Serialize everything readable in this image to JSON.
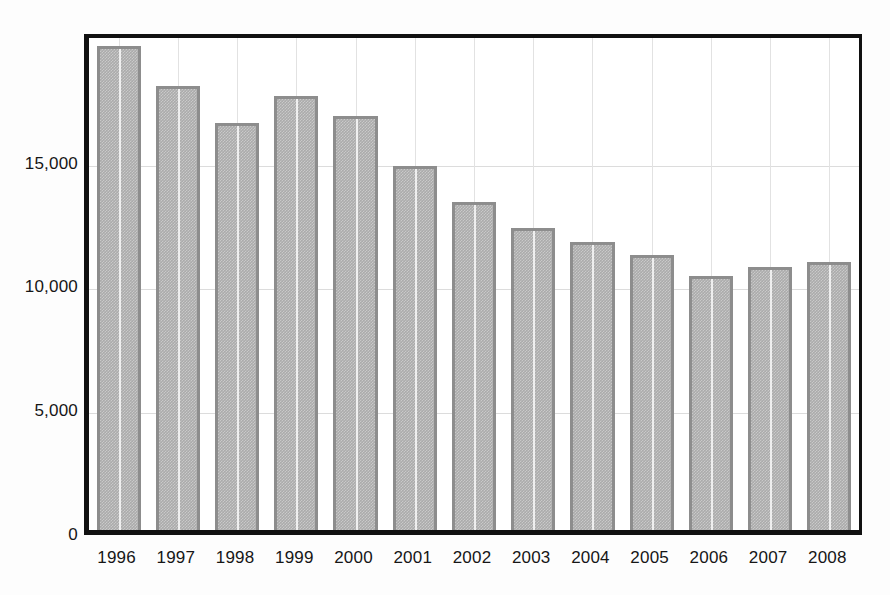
{
  "chart_data": {
    "type": "bar",
    "title": "",
    "subtitle": "",
    "xlabel": "",
    "ylabel": "",
    "categories": [
      "1996",
      "1997",
      "1998",
      "1999",
      "2000",
      "2001",
      "2002",
      "2003",
      "2004",
      "2005",
      "2006",
      "2007",
      "2008"
    ],
    "values": [
      19950,
      18300,
      16800,
      17900,
      17100,
      15000,
      13550,
      12450,
      11900,
      11350,
      10500,
      10850,
      11050
    ],
    "series": [
      {
        "name": "",
        "values": [
          19950,
          18300,
          16800,
          17900,
          17100,
          15000,
          13550,
          12450,
          11900,
          11350,
          10500,
          10850,
          11050
        ]
      }
    ],
    "ylim": [
      0,
      20300
    ],
    "yticks": [
      0,
      5000,
      10000,
      15000
    ],
    "ytick_labels": [
      "0",
      "5,000",
      "10,000",
      "15,000"
    ],
    "grid": true,
    "grid_horizontal": true,
    "grid_vertical": true,
    "legend": false,
    "legend_position": "none",
    "annotations": [],
    "bar_fill_color": "#ababab",
    "bar_border_color": "#8d8d8d",
    "grid_color": "#dcdcdc",
    "axis_color": "#111111",
    "background_color": "#ffffff"
  }
}
